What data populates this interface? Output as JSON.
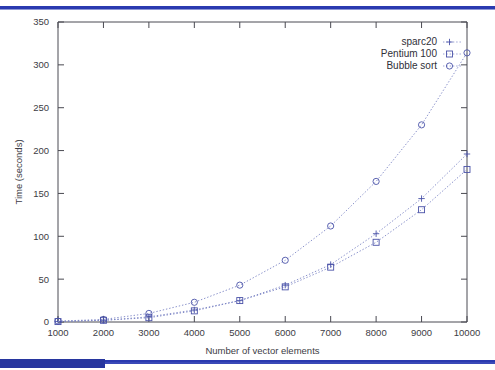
{
  "chart_data": {
    "type": "line",
    "title": "",
    "xlabel": "Number of vector elements",
    "ylabel": "Time (seconds)",
    "x": [
      1000,
      2000,
      3000,
      4000,
      5000,
      6000,
      7000,
      8000,
      9000,
      10000
    ],
    "xlim": [
      1000,
      10000
    ],
    "ylim": [
      0,
      350
    ],
    "xticks": [
      "1000",
      "2000",
      "3000",
      "4000",
      "5000",
      "6000",
      "7000",
      "8000",
      "9000",
      "10000"
    ],
    "yticks": [
      "0",
      "50",
      "100",
      "150",
      "200",
      "250",
      "300",
      "350"
    ],
    "grid": false,
    "legend_position": "top-right",
    "series": [
      {
        "name": "sparc20",
        "marker": "plus",
        "values": [
          0.5,
          2,
          6,
          14,
          25,
          43,
          67,
          103,
          144,
          196
        ]
      },
      {
        "name": "Pentium 100",
        "marker": "square",
        "values": [
          0.5,
          2,
          5,
          13,
          25,
          41,
          64,
          93,
          131,
          178
        ]
      },
      {
        "name": "Bubble sort",
        "marker": "circle",
        "values": [
          1,
          3,
          10,
          23,
          43,
          72,
          112,
          164,
          230,
          314
        ]
      }
    ],
    "colors": {
      "line": "#7b83c4",
      "marker": "#4a52a8",
      "axis": "#4a4a52",
      "accent": "#2a3ab0"
    }
  },
  "slide": {
    "top_rule_color": "#2a3ab0",
    "bottom_rule_color": "#2a3ab0"
  }
}
